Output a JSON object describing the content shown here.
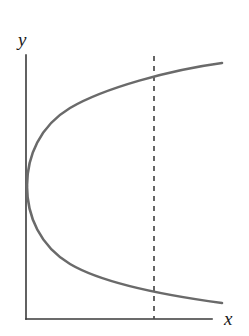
{
  "figure": {
    "background_color": "#ffffff",
    "width": 249,
    "height": 336,
    "axis_color": "#3a3a3a",
    "curve_color": "#6a6a6a",
    "dashed_color": "#4a4a4a",
    "label_color": "#1a1a1a"
  },
  "axes": {
    "x_label": "x",
    "y_label": "y",
    "origin": {
      "x": 26,
      "y": 319
    },
    "x_axis_end": {
      "x": 212,
      "y": 319
    },
    "y_axis_end": {
      "x": 26,
      "y": 55
    }
  },
  "chart_data": {
    "type": "line",
    "title": "",
    "subtitle": "",
    "xlabel": "x",
    "ylabel": "y",
    "grid": false,
    "legend": null,
    "legend_position": "none",
    "xlim": [
      0,
      10
    ],
    "ylim": [
      -5,
      5
    ],
    "series": [
      {
        "name": "upper-branch",
        "style": "solid",
        "color": "#6a6a6a",
        "points": [
          [
            0.05,
            0.0
          ],
          [
            0.1,
            0.42
          ],
          [
            0.22,
            0.78
          ],
          [
            0.4,
            1.08
          ],
          [
            0.7,
            1.42
          ],
          [
            1.1,
            1.76
          ],
          [
            1.6,
            2.08
          ],
          [
            2.2,
            2.38
          ],
          [
            2.9,
            2.66
          ],
          [
            3.7,
            2.92
          ],
          [
            4.6,
            3.18
          ],
          [
            5.6,
            3.42
          ],
          [
            6.7,
            3.66
          ],
          [
            7.9,
            3.88
          ],
          [
            9.2,
            4.1
          ],
          [
            10.4,
            4.3
          ]
        ]
      },
      {
        "name": "lower-branch",
        "style": "solid",
        "color": "#6a6a6a",
        "points": [
          [
            0.05,
            0.0
          ],
          [
            0.1,
            -0.42
          ],
          [
            0.22,
            -0.78
          ],
          [
            0.4,
            -1.08
          ],
          [
            0.7,
            -1.42
          ],
          [
            1.1,
            -1.76
          ],
          [
            1.6,
            -2.08
          ],
          [
            2.2,
            -2.38
          ],
          [
            2.9,
            -2.66
          ],
          [
            3.7,
            -2.92
          ],
          [
            4.6,
            -3.18
          ],
          [
            5.6,
            -3.42
          ],
          [
            6.7,
            -3.66
          ],
          [
            7.9,
            -3.88
          ],
          [
            9.2,
            -4.1
          ],
          [
            10.4,
            -4.3
          ]
        ]
      }
    ],
    "annotations": [
      {
        "name": "vertical-test-line",
        "type": "vline",
        "style": "dashed",
        "color": "#4a4a4a",
        "x": 7.1,
        "y_from": -5.0,
        "y_to": 4.9,
        "label": ""
      },
      {
        "name": "vertex",
        "type": "point",
        "x": 0.05,
        "y": 0.0,
        "label": ""
      }
    ]
  },
  "geometry": {
    "curve_upper_path": "M 27 186 C 27 156, 40 126, 70 108 C 104 88, 170 70, 222 63",
    "curve_lower_path": "M 27 186 C 27 216, 40 246, 70 264 C 104 284, 170 296, 222 303",
    "dashed_line": {
      "x": 154,
      "y_top": 56,
      "y_bottom": 319
    },
    "curve_width": 2.6,
    "axis_width": 1.6,
    "dash_pattern": "5 5"
  }
}
